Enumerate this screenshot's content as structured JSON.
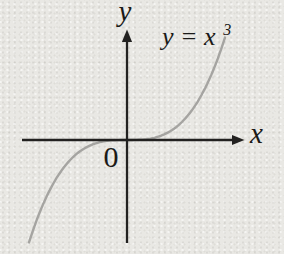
{
  "figure": {
    "background_color": "#e9e8e4",
    "axis_color": "#222120",
    "curve_color": "#a5a4a1",
    "text_color": "#1b1a18",
    "labels": {
      "origin": "0",
      "equation_base": "y = x",
      "equation_exponent": "3"
    }
  },
  "chart_data": {
    "type": "line",
    "equation": "y = x^3",
    "power": 3,
    "x_range": [
      -2,
      2
    ],
    "series": [
      {
        "name": "y = x^3",
        "x": [
          -2,
          -1.5,
          -1,
          -0.5,
          0,
          0.5,
          1,
          1.5,
          2
        ],
        "values": [
          -8,
          -3.375,
          -1,
          -0.125,
          0,
          0.125,
          1,
          3.375,
          8
        ]
      }
    ],
    "xlabel": "x",
    "ylabel": "y",
    "origin_label": "0",
    "annotations": [
      "y = x³",
      "0"
    ],
    "grid": false,
    "legend": false,
    "axes_style": "centered-with-arrowheads, no ticks"
  }
}
